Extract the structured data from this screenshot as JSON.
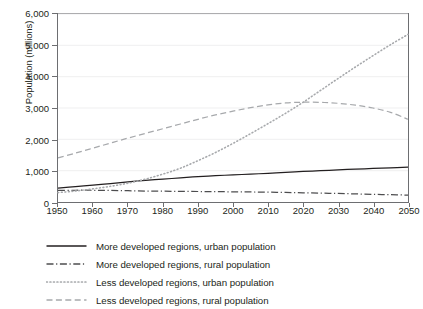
{
  "chart_data": {
    "type": "line",
    "title": "",
    "xlabel": "",
    "ylabel": "Population (millions)",
    "xlim": [
      1950,
      2050
    ],
    "ylim": [
      0,
      6000
    ],
    "xticks": [
      1950,
      1960,
      1970,
      1980,
      1990,
      2000,
      2010,
      2020,
      2030,
      2040,
      2050
    ],
    "xtick_labels": [
      "1950",
      "1960",
      "1970",
      "1980",
      "1990",
      "2000",
      "2010",
      "2020",
      "2030",
      "2040",
      "2050"
    ],
    "yticks": [
      0,
      1000,
      2000,
      3000,
      4000,
      5000,
      6000
    ],
    "ytick_labels": [
      "0",
      "1,000",
      "2,000",
      "3,000",
      "4,000",
      "5,000",
      "6,000"
    ],
    "grid": true,
    "grid_axis": "y",
    "legend_position": "below",
    "x": [
      1950,
      1955,
      1960,
      1965,
      1970,
      1975,
      1980,
      1985,
      1990,
      1995,
      2000,
      2005,
      2010,
      2015,
      2020,
      2025,
      2030,
      2035,
      2040,
      2045,
      2050
    ],
    "series": [
      {
        "name": "More developed regions, urban population",
        "style": "solid",
        "color": "#231f20",
        "values": [
          440,
          490,
          540,
          590,
          645,
          690,
          730,
          770,
          810,
          840,
          865,
          890,
          915,
          945,
          975,
          1000,
          1025,
          1050,
          1070,
          1090,
          1110
        ]
      },
      {
        "name": "More developed regions, rural population",
        "style": "dashdot",
        "color": "#4d4d4f",
        "values": [
          370,
          375,
          375,
          370,
          360,
          350,
          345,
          340,
          335,
          330,
          325,
          320,
          315,
          305,
          295,
          285,
          272,
          258,
          245,
          232,
          220
        ]
      },
      {
        "name": "Less developed regions, urban population",
        "style": "dotted",
        "color": "#a7a9ac",
        "values": [
          300,
          350,
          420,
          500,
          600,
          730,
          890,
          1080,
          1320,
          1580,
          1870,
          2180,
          2500,
          2830,
          3180,
          3560,
          3940,
          4310,
          4670,
          5020,
          5350
        ]
      },
      {
        "name": "Less developed regions, rural population",
        "style": "dashed",
        "color": "#a7a9ac",
        "values": [
          1410,
          1560,
          1720,
          1880,
          2040,
          2190,
          2340,
          2490,
          2640,
          2780,
          2900,
          3010,
          3100,
          3160,
          3185,
          3180,
          3150,
          3090,
          3000,
          2860,
          2640
        ]
      }
    ]
  },
  "axis": {
    "ylabel": "Population (millions)"
  },
  "legend": {
    "items": [
      {
        "label": "More developed regions, urban population"
      },
      {
        "label": "More developed regions, rural population"
      },
      {
        "label": "Less developed regions, urban population"
      },
      {
        "label": "Less developed regions, rural population"
      }
    ]
  }
}
